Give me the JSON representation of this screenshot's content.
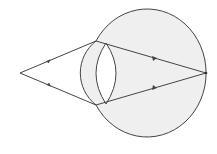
{
  "diagram": {
    "title": "",
    "colors": {
      "background": "#ffffff",
      "eye_fill": "#efefef",
      "lens_fill": "#ffffff",
      "stroke": "#444444"
    },
    "object_point": {
      "x": 20,
      "y": 73
    },
    "focus_point": {
      "x": 206,
      "y": 73
    },
    "rays": [
      {
        "name": "upper-ray",
        "points": [
          [
            20,
            73
          ],
          [
            96,
            41
          ],
          [
            206,
            73
          ]
        ]
      },
      {
        "name": "lower-ray",
        "points": [
          [
            20,
            73
          ],
          [
            96,
            105
          ],
          [
            206,
            73
          ]
        ]
      }
    ],
    "labels": []
  }
}
